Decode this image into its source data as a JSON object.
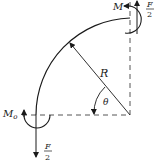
{
  "diagram": {
    "type": "curved-beam-free-body",
    "labels": {
      "moment_top": "M",
      "moment_bottom_main": "M",
      "moment_bottom_sub": "o",
      "force_numerator": "F",
      "force_denominator": "2",
      "radius": "R",
      "angle": "θ"
    },
    "colors": {
      "line": "#1a1a1a",
      "dashed": "#555555"
    }
  }
}
